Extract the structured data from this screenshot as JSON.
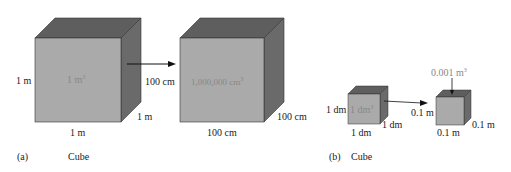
{
  "colors": {
    "front": "#aaaaaa",
    "top": "#5e5e5e",
    "side": "#6a6a6a",
    "edge": "#333333"
  },
  "panel_a": {
    "label": "(a)",
    "caption": "Cube",
    "cube1": {
      "volume": "1 m",
      "volume_exp": "3",
      "height": "1 m",
      "width": "1 m",
      "depth": "1 m"
    },
    "arrow_label": "100 cm",
    "cube2": {
      "volume": "1,000,000 cm",
      "volume_exp": "3",
      "width": "100 cm",
      "depth": "100 cm"
    }
  },
  "panel_b": {
    "label": "(b)",
    "caption": "Cube",
    "cube1": {
      "volume": "1 dm",
      "volume_exp": "3",
      "height": "1 dm",
      "width": "1 dm",
      "depth": "1 dm"
    },
    "cube2": {
      "volume_callout": "0.001 m",
      "volume_exp": "3",
      "height": "0.1 m",
      "width": "0.1 m",
      "depth": "0.1 m"
    }
  }
}
